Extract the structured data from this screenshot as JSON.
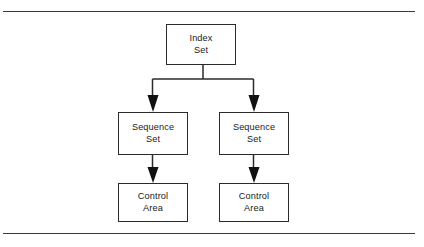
{
  "figure": {
    "background_color": "#ffffff",
    "line_color": "#2b2b2b",
    "rule_color": "#3a3a3a",
    "width": 424,
    "height": 247
  },
  "rules": {
    "top_label": "top-horizontal-rule",
    "bottom_label": "bottom-horizontal-rule"
  },
  "diagram": {
    "type": "tree",
    "nodes": [
      {
        "id": "index-set",
        "line1": "Index",
        "line2": "Set",
        "level": 0
      },
      {
        "id": "sequence-set-left",
        "line1": "Sequence",
        "line2": "Set",
        "level": 1
      },
      {
        "id": "sequence-set-right",
        "line1": "Sequence",
        "line2": "Set",
        "level": 1
      },
      {
        "id": "control-area-left",
        "line1": "Control",
        "line2": "Area",
        "level": 2
      },
      {
        "id": "control-area-right",
        "line1": "Control",
        "line2": "Area",
        "level": 2
      }
    ],
    "edges": [
      {
        "from": "index-set",
        "to": "sequence-set-left",
        "arrow": "down"
      },
      {
        "from": "index-set",
        "to": "sequence-set-right",
        "arrow": "down"
      },
      {
        "from": "sequence-set-left",
        "to": "control-area-left",
        "arrow": "down"
      },
      {
        "from": "sequence-set-right",
        "to": "control-area-right",
        "arrow": "down"
      }
    ]
  }
}
